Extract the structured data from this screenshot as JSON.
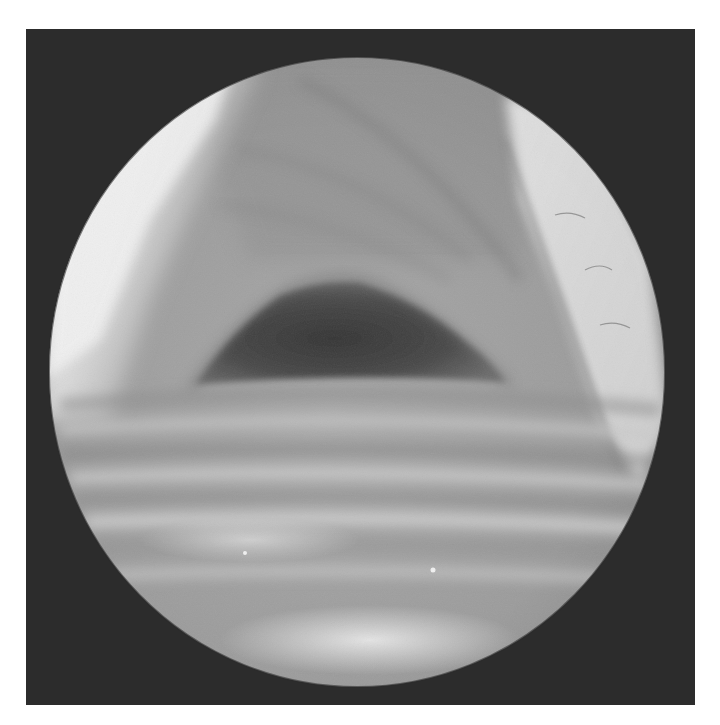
{
  "image": {
    "kind": "endoscopic-view",
    "description": "Grayscale circular endoscopic view of an airway: dark triangular lumen opening at center, horizontal ring-like folds in lower half, bright highlights along upper-left rim and a bright diagonal band on the right",
    "colors": {
      "page_background": "#ffffff",
      "frame_background": "#2c2c2c",
      "field_mid": "#9a9a9a",
      "field_light": "#d8d8d8",
      "field_highlight": "#f2f2f2",
      "lumen_dark": "#3e3e3e"
    },
    "field_of_view": {
      "center_x": 357,
      "center_y": 372,
      "radius_x": 308,
      "radius_y": 315
    }
  }
}
